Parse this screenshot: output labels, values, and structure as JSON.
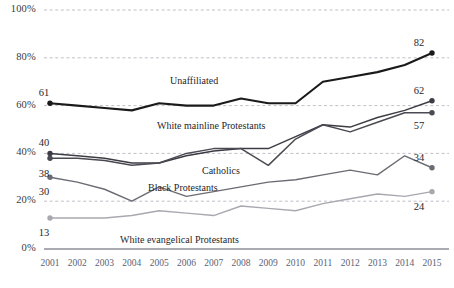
{
  "chart_data": {
    "type": "line",
    "title": "",
    "xlabel": "",
    "ylabel": "",
    "ylim": [
      0,
      100
    ],
    "ytick_labels": [
      "0%",
      "20%",
      "40%",
      "60%",
      "80%",
      "100%"
    ],
    "yticks": [
      0,
      20,
      40,
      60,
      80,
      100
    ],
    "grid": "horizontal-dashed",
    "legend": "inline-series-labels",
    "x": [
      2001,
      2002,
      2003,
      2004,
      2005,
      2006,
      2007,
      2008,
      2009,
      2010,
      2011,
      2012,
      2013,
      2014,
      2015
    ],
    "categories": [
      "2001",
      "2002",
      "2003",
      "2004",
      "2005",
      "2006",
      "2007",
      "2008",
      "2009",
      "2010",
      "2011",
      "2012",
      "2013",
      "2014",
      "2015"
    ],
    "series": [
      {
        "name": "Unaffiliated",
        "color": "#1a1a1a",
        "width": 2.1,
        "start_value": 61,
        "end_value": 82,
        "values": [
          61,
          60,
          59,
          58,
          61,
          60,
          60,
          63,
          61,
          61,
          70,
          72,
          74,
          77,
          82
        ]
      },
      {
        "name": "White mainline Protestants",
        "color": "#3c3c44",
        "width": 1.5,
        "start_value": 40,
        "end_value": 62,
        "values": [
          40,
          39,
          38,
          36,
          36,
          39,
          41,
          42,
          42,
          47,
          52,
          51,
          55,
          58,
          62
        ]
      },
      {
        "name": "Catholics",
        "color": "#4a4a52",
        "width": 1.5,
        "start_value": 38,
        "end_value": 57,
        "values": [
          38,
          38,
          37,
          35,
          36,
          40,
          42,
          42,
          35,
          46,
          52,
          49,
          53,
          57,
          57
        ]
      },
      {
        "name": "Black Protestants",
        "color": "#6b6b74",
        "width": 1.4,
        "start_value": 30,
        "end_value": 34,
        "values": [
          30,
          28,
          25,
          20,
          26,
          22,
          24,
          26,
          28,
          29,
          31,
          33,
          31,
          39,
          34
        ]
      },
      {
        "name": "White evangelical Protestants",
        "color": "#a8a8b0",
        "width": 1.4,
        "start_value": 13,
        "end_value": 24,
        "values": [
          13,
          13,
          13,
          14,
          16,
          15,
          14,
          18,
          17,
          16,
          19,
          21,
          23,
          22,
          24
        ]
      }
    ],
    "series_label_positions": [
      {
        "name": "Unaffiliated",
        "x": 170,
        "y": 75
      },
      {
        "name": "White mainline Protestants",
        "x": 157,
        "y": 120
      },
      {
        "name": "Catholics",
        "x": 202,
        "y": 165
      },
      {
        "name": "Black Protestants",
        "x": 148,
        "y": 182
      },
      {
        "name": "White evangelical Protestants",
        "x": 120,
        "y": 234
      }
    ]
  },
  "axis": {
    "y_ticks": [
      {
        "label": "100%",
        "value": 100
      },
      {
        "label": "80%",
        "value": 80
      },
      {
        "label": "60%",
        "value": 60
      },
      {
        "label": "40%",
        "value": 40
      },
      {
        "label": "20%",
        "value": 20
      },
      {
        "label": "0%",
        "value": 0
      }
    ]
  },
  "colors": {
    "background": "#ffffff",
    "gridline": "#b9b9c2",
    "baseline": "#8e8e98",
    "text": "#27272b",
    "xtick_text": "#5b6274"
  }
}
